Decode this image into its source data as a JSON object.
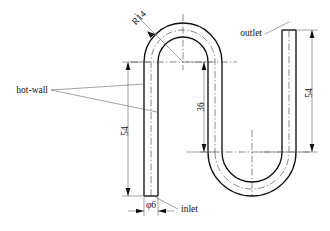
{
  "drawing": {
    "title": "Serpentine tube dimensioned drawing",
    "background_color": "#ffffff",
    "line_color": "#111111",
    "thin_line_color": "#555555",
    "annotations": {
      "radius": "R14",
      "outlet": "outlet",
      "inlet": "inlet",
      "hot_wall": "hot-wall",
      "dim_left_height": "54",
      "dim_right_height": "54",
      "dim_middle_height": "36",
      "dim_diameter": "φ6"
    },
    "geometry": {
      "tube_outer_width": 14,
      "bend_radius": 14,
      "left_leg_height": 54,
      "right_leg_height": 54,
      "middle_leg_height": 36,
      "diameter": 6
    }
  }
}
